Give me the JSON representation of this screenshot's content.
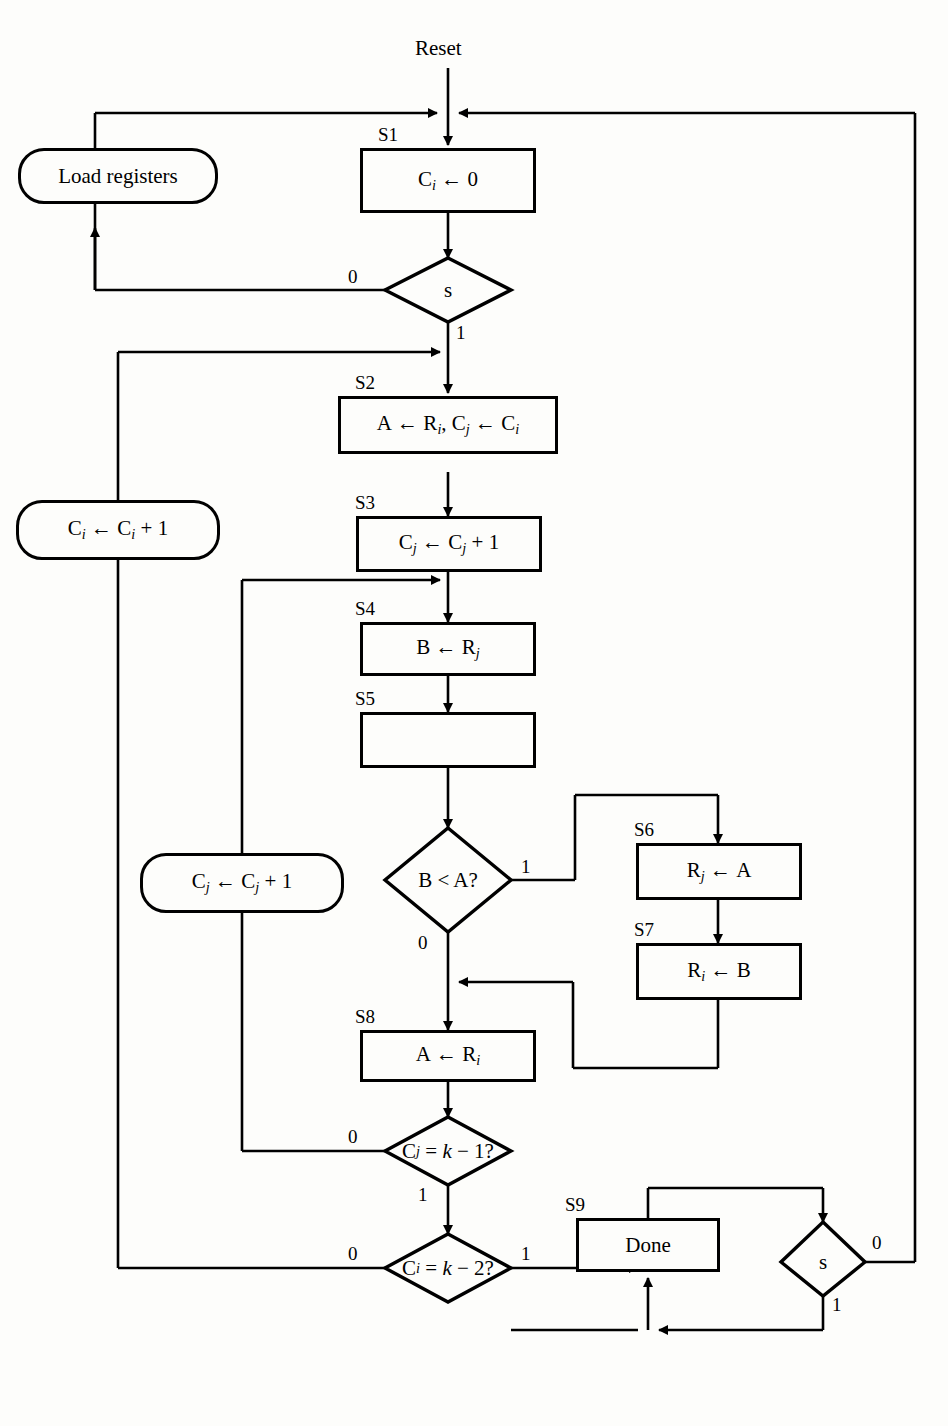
{
  "diagram": {
    "entry_label": "Reset",
    "states": [
      {
        "id": "S1",
        "label": "S1",
        "text": "C_i ← 0",
        "shape": "rect"
      },
      {
        "id": "S2",
        "label": "S2",
        "text": "A ← R_i, C_j ← C_i",
        "shape": "rect"
      },
      {
        "id": "S3",
        "label": "S3",
        "text": "C_j ← C_j + 1",
        "shape": "rect"
      },
      {
        "id": "S4",
        "label": "S4",
        "text": "B ← R_j",
        "shape": "rect"
      },
      {
        "id": "S5",
        "label": "S5",
        "text": "",
        "shape": "rect"
      },
      {
        "id": "S6",
        "label": "S6",
        "text": "R_j ← A",
        "shape": "rect"
      },
      {
        "id": "S7",
        "label": "S7",
        "text": "R_i ← B",
        "shape": "rect"
      },
      {
        "id": "S8",
        "label": "S8",
        "text": "A ← R_i",
        "shape": "rect"
      },
      {
        "id": "S9",
        "label": "S9",
        "text": "Done",
        "shape": "rect"
      }
    ],
    "operations": [
      {
        "id": "load",
        "text": "Load registers",
        "shape": "rounded"
      },
      {
        "id": "inc_i",
        "text": "C_i ← C_i + 1",
        "shape": "rounded"
      },
      {
        "id": "inc_j",
        "text": "C_j ← C_j + 1",
        "shape": "rounded"
      }
    ],
    "decisions": [
      {
        "id": "d_s_top",
        "text": "s",
        "branch_left": "0",
        "branch_down": "1"
      },
      {
        "id": "d_bltA",
        "text": "B < A?",
        "branch_right": "1",
        "branch_down": "0"
      },
      {
        "id": "d_cj",
        "text": "C_j = k − 1?",
        "branch_left": "0",
        "branch_down": "1"
      },
      {
        "id": "d_ci",
        "text": "C_i = k − 2?",
        "branch_left": "0",
        "branch_right": "1"
      },
      {
        "id": "d_s_bottom",
        "text": "s",
        "branch_right": "0",
        "branch_down": "1"
      }
    ],
    "labels": {
      "reset": "Reset",
      "s": "s",
      "zero": "0",
      "one": "1",
      "done": "Done",
      "load_registers": "Load registers"
    },
    "colors": {
      "line": "#000000",
      "background": "#fdfdfb",
      "text": "#000000"
    }
  }
}
